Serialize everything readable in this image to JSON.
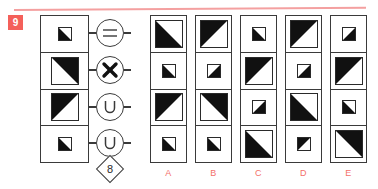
{
  "puzzle": {
    "number": "9",
    "badge_color": "#f4605a",
    "rule_color": "#f4a0a0",
    "label_color": "#f4706a",
    "fill_color": "#111111",
    "stroke_color": "#2a2a2a"
  },
  "stem": {
    "cells": [
      {
        "size": "small",
        "shading": "upper-left"
      },
      {
        "size": "big",
        "shading": "lower-left"
      },
      {
        "size": "big",
        "shading": "lower-right"
      },
      {
        "size": "small",
        "shading": "upper-left"
      }
    ]
  },
  "operators": [
    {
      "name": "equals-operator",
      "glyph": "equals",
      "row": 1
    },
    {
      "name": "cross-operator",
      "glyph": "cross",
      "row": 2
    },
    {
      "name": "union-operator",
      "glyph": "union",
      "row": 3
    },
    {
      "name": "union-operator-2",
      "glyph": "union",
      "row": 4
    }
  ],
  "marker": {
    "shape": "diamond",
    "value": "8"
  },
  "options": [
    {
      "label": "A",
      "cells": [
        {
          "size": "big",
          "shading": "upper-left"
        },
        {
          "size": "small",
          "shading": "upper-left"
        },
        {
          "size": "big",
          "shading": "lower-right"
        },
        {
          "size": "small",
          "shading": "upper-left"
        }
      ]
    },
    {
      "label": "B",
      "cells": [
        {
          "size": "big",
          "shading": "lower-right"
        },
        {
          "size": "small",
          "shading": "upper-right"
        },
        {
          "size": "big",
          "shading": "lower-left"
        },
        {
          "size": "small",
          "shading": "upper-left"
        }
      ]
    },
    {
      "label": "C",
      "cells": [
        {
          "size": "small",
          "shading": "upper-left"
        },
        {
          "size": "big",
          "shading": "lower-right"
        },
        {
          "size": "small",
          "shading": "upper-right"
        },
        {
          "size": "big",
          "shading": "upper-left"
        }
      ]
    },
    {
      "label": "D",
      "cells": [
        {
          "size": "big",
          "shading": "lower-right"
        },
        {
          "size": "small",
          "shading": "upper-right"
        },
        {
          "size": "big",
          "shading": "upper-left"
        },
        {
          "size": "small",
          "shading": "lower-right"
        }
      ]
    },
    {
      "label": "E",
      "cells": [
        {
          "size": "small",
          "shading": "upper-right"
        },
        {
          "size": "big",
          "shading": "lower-right"
        },
        {
          "size": "small",
          "shading": "upper-left"
        },
        {
          "size": "big",
          "shading": "lower-left"
        }
      ]
    }
  ]
}
